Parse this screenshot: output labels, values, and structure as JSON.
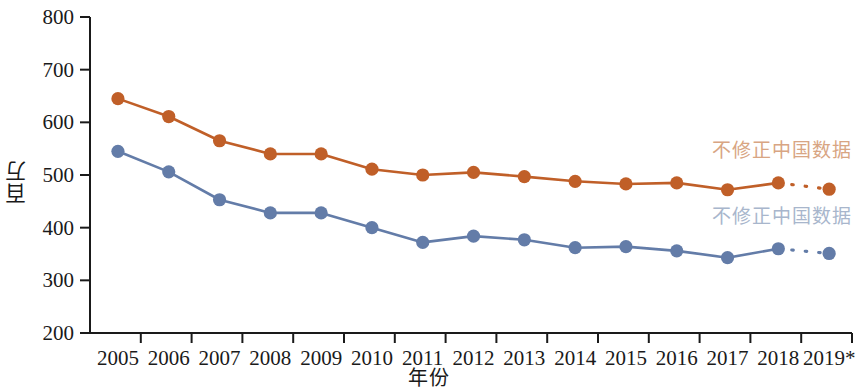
{
  "chart_data": {
    "type": "line",
    "title": "",
    "xlabel": "年份",
    "ylabel": "百万",
    "ylim": [
      200,
      800
    ],
    "yticks": [
      200,
      300,
      400,
      500,
      600,
      700,
      800
    ],
    "grid": false,
    "legend_position": "inline-right",
    "categories": [
      "2005",
      "2006",
      "2007",
      "2008",
      "2009",
      "2010",
      "2011",
      "2012",
      "2013",
      "2014",
      "2015",
      "2016",
      "2017",
      "2018",
      "2019*"
    ],
    "x": [
      2005,
      2006,
      2007,
      2008,
      2009,
      2010,
      2011,
      2012,
      2013,
      2014,
      2015,
      2016,
      2017,
      2018,
      2019
    ],
    "series": [
      {
        "name": "不修正中国数据",
        "color": "#C05F28",
        "label_color": "#D8A583",
        "dashed_from_index": 13,
        "values": [
          645,
          611,
          565,
          540,
          540,
          511,
          500,
          505,
          497,
          488,
          483,
          485,
          472,
          485,
          473
        ]
      },
      {
        "name": "不修正中国数据",
        "color": "#637CA8",
        "label_color": "#A8B6CC",
        "dashed_from_index": 13,
        "values": [
          545,
          506,
          453,
          428,
          428,
          400,
          372,
          384,
          377,
          362,
          364,
          356,
          343,
          360,
          351
        ]
      }
    ],
    "annotations": [
      {
        "text": "不修正中国数据",
        "series_index": 0
      },
      {
        "text": "不修正中国数据",
        "series_index": 1
      }
    ]
  },
  "axis": {
    "y_title": "百万",
    "x_title": "年份",
    "y_tick_labels": [
      "800",
      "700",
      "600",
      "500",
      "400",
      "300",
      "200"
    ],
    "x_tick_labels": [
      "2005",
      "2006",
      "2007",
      "2008",
      "2009",
      "2010",
      "2011",
      "2012",
      "2013",
      "2014",
      "2015",
      "2016",
      "2017",
      "2018",
      "2019*"
    ]
  },
  "colors": {
    "series_orange": "#C05F28",
    "series_blue": "#637CA8",
    "axis": "#1a1a1a",
    "background": "#ffffff"
  }
}
